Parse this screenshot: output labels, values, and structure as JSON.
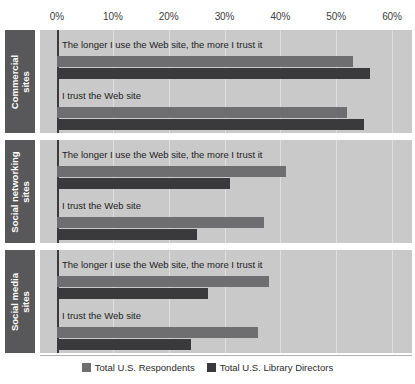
{
  "chart_data": {
    "type": "bar",
    "orientation": "horizontal",
    "title": "",
    "xlabel": "",
    "ylabel": "",
    "xlim": [
      0,
      60
    ],
    "xticks": [
      0,
      10,
      20,
      30,
      40,
      50,
      60
    ],
    "xtick_labels": [
      "0%",
      "10%",
      "20%",
      "30%",
      "40%",
      "50%",
      "60%"
    ],
    "grid": true,
    "legend_position": "bottom",
    "legend": [
      "Total U.S. Respondents",
      "Total U.S. Library Directors"
    ],
    "series_colors": [
      "#6e6e70",
      "#3a3a3c"
    ],
    "groups": [
      {
        "category": "Commercial sites",
        "category_lines": [
          "Commercial",
          "sites"
        ],
        "items": [
          {
            "label": "The longer I use the Web site, the more I trust it",
            "values": [
              53,
              56
            ]
          },
          {
            "label": "I trust the Web site",
            "values": [
              52,
              55
            ]
          }
        ]
      },
      {
        "category": "Social networking sites",
        "category_lines": [
          "Social networking",
          "sites"
        ],
        "items": [
          {
            "label": "The longer I use the Web site, the more I trust it",
            "values": [
              41,
              31
            ]
          },
          {
            "label": "I trust the Web site",
            "values": [
              37,
              25
            ]
          }
        ]
      },
      {
        "category": "Social media sites",
        "category_lines": [
          "Social media",
          "sites"
        ],
        "items": [
          {
            "label": "The longer I use the Web site, the more I trust it",
            "values": [
              38,
              27
            ]
          },
          {
            "label": "I trust the Web site",
            "values": [
              36,
              24
            ]
          }
        ]
      }
    ]
  }
}
